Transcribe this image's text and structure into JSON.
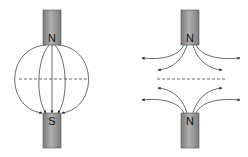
{
  "diagram": {
    "left": {
      "description": "Unlike poles facing: field lines connect N to S",
      "top_magnet": {
        "pole": "N"
      },
      "bottom_magnet": {
        "pole": "S"
      }
    },
    "right": {
      "description": "Like poles facing: field lines repel outward",
      "top_magnet": {
        "pole": "N"
      },
      "bottom_magnet": {
        "pole": "N"
      }
    },
    "colors": {
      "magnet_fill": "#9a9a9a",
      "magnet_dark": "#6e6e6e",
      "line": "#333333"
    }
  }
}
